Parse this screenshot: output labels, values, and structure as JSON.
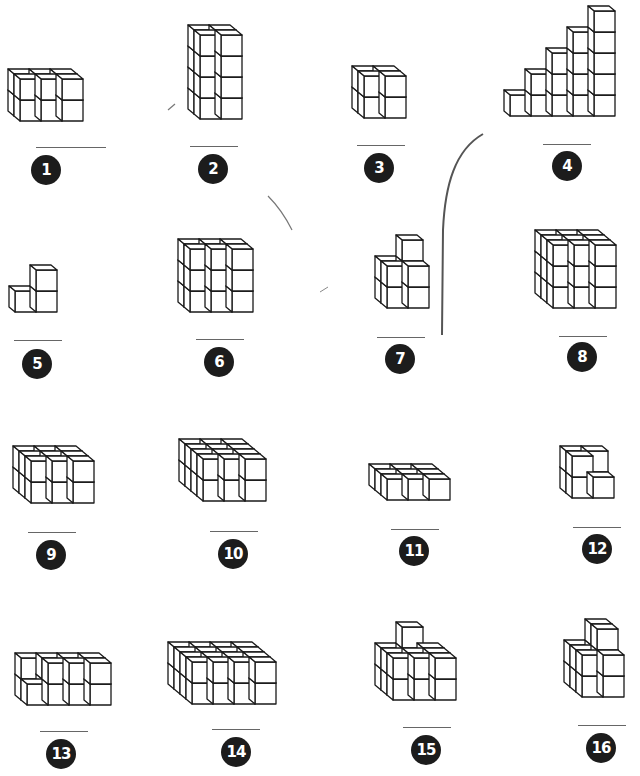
{
  "worksheet": {
    "instructions_visible": false,
    "cube_size": 21,
    "depth_dx": -6,
    "depth_dy": -5,
    "items": [
      {
        "number": "1",
        "label_pos": [
          46,
          170
        ],
        "blank": [
          36,
          147,
          70
        ],
        "origin": [
          20,
          121
        ],
        "cols": 3,
        "rows": 2,
        "depth": 2,
        "columns": [
          [
            2,
            2
          ],
          [
            2,
            2
          ],
          [
            2,
            2
          ]
        ]
      },
      {
        "number": "2",
        "label_pos": [
          213,
          169
        ],
        "blank": [
          190,
          146,
          48
        ],
        "origin": [
          200,
          119
        ],
        "cols": 2,
        "rows": 4,
        "depth": 2,
        "columns": [
          [
            4,
            4
          ],
          [
            4,
            4
          ]
        ]
      },
      {
        "number": "3",
        "label_pos": [
          379,
          168
        ],
        "blank": [
          357,
          145,
          48
        ],
        "origin": [
          364,
          118
        ],
        "cols": 2,
        "rows": 2,
        "depth": 2,
        "columns": [
          [
            2,
            2
          ],
          [
            2,
            2
          ]
        ]
      },
      {
        "number": "4",
        "label_pos": [
          567,
          166
        ],
        "blank": [
          543,
          144,
          48
        ],
        "origin": [
          510,
          116
        ],
        "cols": 5,
        "rows": 5,
        "depth": 1,
        "columns": [
          [
            1
          ],
          [
            2
          ],
          [
            3
          ],
          [
            4
          ],
          [
            5
          ]
        ]
      },
      {
        "number": "5",
        "label_pos": [
          37,
          364
        ],
        "blank": [
          14,
          340,
          48
        ],
        "origin": [
          15,
          312
        ],
        "cols": 2,
        "rows": 2,
        "depth": 1,
        "columns": [
          [
            1
          ],
          [
            2
          ]
        ]
      },
      {
        "number": "6",
        "label_pos": [
          219,
          362
        ],
        "blank": [
          196,
          339,
          48
        ],
        "origin": [
          190,
          312
        ],
        "cols": 3,
        "rows": 3,
        "depth": 2,
        "columns": [
          [
            3,
            3
          ],
          [
            3,
            3
          ],
          [
            3,
            3
          ]
        ]
      },
      {
        "number": "7",
        "label_pos": [
          400,
          359
        ],
        "blank": [
          377,
          337,
          48
        ],
        "origin": [
          387,
          308
        ],
        "cols": 2,
        "rows": 3,
        "depth": 2,
        "columns": [
          [
            2,
            2
          ],
          [
            2,
            3
          ]
        ]
      },
      {
        "number": "8",
        "label_pos": [
          582,
          357
        ],
        "blank": [
          559,
          336,
          48
        ],
        "origin": [
          553,
          308
        ],
        "cols": 3,
        "rows": 3,
        "depth": 3,
        "columns": [
          [
            3,
            3,
            3
          ],
          [
            3,
            3,
            3
          ],
          [
            3,
            3,
            3
          ]
        ]
      },
      {
        "number": "9",
        "label_pos": [
          51,
          555
        ],
        "blank": [
          28,
          532,
          48
        ],
        "origin": [
          31,
          503
        ],
        "cols": 3,
        "rows": 2,
        "depth": 3,
        "columns": [
          [
            2,
            2,
            2
          ],
          [
            2,
            2,
            2
          ],
          [
            2,
            2,
            2
          ]
        ]
      },
      {
        "number": "10",
        "label_pos": [
          233,
          554
        ],
        "blank": [
          210,
          531,
          48
        ],
        "origin": [
          203,
          501
        ],
        "cols": 3,
        "rows": 2,
        "depth": 4,
        "columns": [
          [
            2,
            2,
            2,
            2
          ],
          [
            2,
            2,
            2,
            2
          ],
          [
            2,
            2,
            2,
            2
          ]
        ]
      },
      {
        "number": "11",
        "label_pos": [
          414,
          551
        ],
        "blank": [
          391,
          529,
          48
        ],
        "origin": [
          387,
          500
        ],
        "cols": 3,
        "rows": 1,
        "depth": 3,
        "columns": [
          [
            1,
            1,
            1
          ],
          [
            1,
            1,
            1
          ],
          [
            1,
            1,
            1
          ]
        ]
      },
      {
        "number": "12",
        "label_pos": [
          597,
          549
        ],
        "blank": [
          573,
          527,
          48
        ],
        "origin": [
          572,
          498
        ],
        "cols": 2,
        "rows": 2,
        "depth": 2,
        "columns": [
          [
            2,
            2
          ],
          [
            1,
            2
          ]
        ]
      },
      {
        "number": "13",
        "label_pos": [
          61,
          754
        ],
        "blank": [
          40,
          731,
          48
        ],
        "origin": [
          27,
          705
        ],
        "cols": 4,
        "rows": 2,
        "depth": 2,
        "columns": [
          [
            1,
            2
          ],
          [
            2,
            2
          ],
          [
            2,
            2
          ],
          [
            2,
            2
          ]
        ]
      },
      {
        "number": "14",
        "label_pos": [
          236,
          752
        ],
        "blank": [
          212,
          729,
          48
        ],
        "origin": [
          192,
          704
        ],
        "cols": 4,
        "rows": 2,
        "depth": 4,
        "columns": [
          [
            2,
            2,
            2,
            2
          ],
          [
            2,
            2,
            2,
            2
          ],
          [
            2,
            2,
            2,
            2
          ],
          [
            2,
            2,
            2,
            2
          ]
        ]
      },
      {
        "number": "15",
        "label_pos": [
          426,
          750
        ],
        "blank": [
          403,
          727,
          48
        ],
        "origin": [
          393,
          700
        ],
        "cols": 3,
        "rows": 3,
        "depth": 3,
        "columns": [
          [
            2,
            2,
            2
          ],
          [
            2,
            2,
            3
          ],
          [
            2,
            2,
            2
          ]
        ]
      },
      {
        "number": "16",
        "label_pos": [
          601,
          748
        ],
        "blank": [
          578,
          725,
          48
        ],
        "origin": [
          582,
          697
        ],
        "cols": 2,
        "rows": 3,
        "depth": 3,
        "columns": [
          [
            2,
            2,
            2
          ],
          [
            2,
            3,
            3
          ]
        ]
      }
    ]
  },
  "colors": {
    "line": "#1a1a1a",
    "badge": "#1c1c1c",
    "blank": "#666666",
    "pencil": "#555555"
  }
}
